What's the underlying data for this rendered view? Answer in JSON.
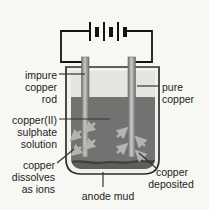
{
  "labels": {
    "impure_copper_rod": {
      "lines": [
        "impure",
        "copper",
        "rod"
      ]
    },
    "pure_copper": {
      "lines": [
        "pure",
        "copper"
      ]
    },
    "copper_sulphate_solution": {
      "lines": [
        "copper(II)",
        "sulphate",
        "solution"
      ]
    },
    "copper_dissolves": {
      "lines": [
        "copper",
        "dissolves",
        "as ions"
      ]
    },
    "copper_deposited": {
      "lines": [
        "copper",
        "deposited"
      ]
    },
    "anode_mud": {
      "text": "anode mud"
    }
  },
  "battery": {
    "cells": 3
  },
  "colors": {
    "background": "#f7f7f4",
    "solution": "#727270",
    "air_gap": "#e4e4e1",
    "glass": "#f0f0ed",
    "outline": "#2d2d2d",
    "electrode_edge": "#6e6e6c",
    "electrode_center": "#cbcbc9",
    "mud": "#5e5e5c",
    "mud_line": "#3e3e3c",
    "arrow": "#b3b3b1",
    "wire": "#141414",
    "text": "#232323",
    "leader": "#333333"
  }
}
